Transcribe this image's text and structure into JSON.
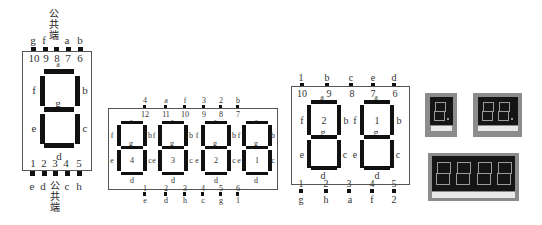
{
  "single_digit": {
    "top_common_label": [
      "公",
      "共",
      "端"
    ],
    "top_segment_labels": [
      "g",
      "f",
      "",
      "a",
      "b"
    ],
    "top_pin_numbers": [
      "10",
      "9",
      "8",
      "7",
      "6"
    ],
    "bottom_pin_numbers": [
      "1",
      "2",
      "3",
      "4",
      "5"
    ],
    "bottom_segment_labels": [
      "e",
      "d",
      "",
      "c",
      "h"
    ],
    "bottom_common_label": [
      "公",
      "共",
      "端"
    ],
    "segments": {
      "a": "a",
      "b": "b",
      "c": "c",
      "d": "d",
      "e": "e",
      "f": "f",
      "g": "g"
    }
  },
  "four_digit": {
    "top_signal_labels": [
      "4",
      "a",
      "f",
      "3",
      "2",
      "b"
    ],
    "top_pin_numbers": [
      "12",
      "11",
      "10",
      "9",
      "8",
      "7"
    ],
    "bottom_pin_numbers": [
      "1",
      "2",
      "3",
      "4",
      "5",
      "6"
    ],
    "bottom_signal_labels": [
      "e",
      "d",
      "h",
      "c",
      "g",
      "1"
    ],
    "digits": [
      {
        "index": "4",
        "a": "a",
        "b": "b",
        "c": "c",
        "d": "d",
        "e": "e",
        "f": "f",
        "g": "g"
      },
      {
        "index": "3",
        "a": "a",
        "b": "b",
        "c": "c",
        "d": "d",
        "e": "e",
        "f": "f",
        "g": "g"
      },
      {
        "index": "2",
        "a": "a",
        "b": "b",
        "c": "c",
        "d": "d",
        "e": "e",
        "f": "f",
        "g": "g"
      },
      {
        "index": "1",
        "a": "a",
        "b": "b",
        "c": "c",
        "d": "d",
        "e": "e",
        "f": "f",
        "g": "g"
      }
    ]
  },
  "two_digit": {
    "top_signal_labels": [
      "1",
      "b",
      "c",
      "e",
      "d"
    ],
    "top_pin_numbers": [
      "10",
      "9",
      "8",
      "7",
      "6"
    ],
    "bottom_pin_numbers": [
      "1",
      "2",
      "3",
      "4",
      "5"
    ],
    "bottom_signal_labels": [
      "g",
      "h",
      "a",
      "f",
      "2"
    ],
    "digits": [
      {
        "index": "2",
        "a": "a",
        "b": "b",
        "c": "c",
        "d": "d",
        "e": "e",
        "f": "f",
        "g": "g"
      },
      {
        "index": "1",
        "a": "a",
        "b": "b",
        "c": "c",
        "d": "d",
        "e": "e",
        "f": "f",
        "g": "g"
      }
    ]
  },
  "photos": [
    {
      "name": "single-digit-display-photo",
      "digits": 1
    },
    {
      "name": "two-digit-display-photo",
      "digits": 2
    },
    {
      "name": "four-digit-display-photo",
      "digits": 4
    }
  ]
}
